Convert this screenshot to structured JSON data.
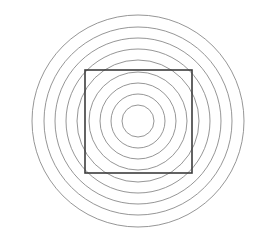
{
  "figure": {
    "background_color": "#ffffff",
    "width": 265,
    "height": 246
  },
  "chart_data": {
    "type": "scatter",
    "title": "",
    "subtitle": "",
    "xlabel": "",
    "ylabel": "",
    "grid": false,
    "legend": false,
    "axes_visible": false,
    "tick_labels": [],
    "annotations": [],
    "center": {
      "x": 138,
      "y": 121
    },
    "shapes": [
      {
        "kind": "circle",
        "name": "ring-1-innermost",
        "index": 1,
        "cx": 138,
        "cy": 121,
        "r": 16,
        "stroke": "#8a8a8a",
        "stroke_width": 0.9,
        "fill": "none"
      },
      {
        "kind": "circle",
        "name": "ring-2",
        "index": 2,
        "cx": 138,
        "cy": 121,
        "r": 27,
        "stroke": "#8a8a8a",
        "stroke_width": 0.9,
        "fill": "none"
      },
      {
        "kind": "circle",
        "name": "ring-3",
        "index": 3,
        "cx": 138,
        "cy": 121,
        "r": 38,
        "stroke": "#8a8a8a",
        "stroke_width": 0.9,
        "fill": "none"
      },
      {
        "kind": "circle",
        "name": "ring-4",
        "index": 4,
        "cx": 138,
        "cy": 121,
        "r": 49,
        "stroke": "#8a8a8a",
        "stroke_width": 0.9,
        "fill": "none"
      },
      {
        "kind": "circle",
        "name": "ring-5",
        "index": 5,
        "cx": 138,
        "cy": 121,
        "r": 61,
        "stroke": "#8a8a8a",
        "stroke_width": 0.9,
        "fill": "none"
      },
      {
        "kind": "circle",
        "name": "ring-6",
        "index": 6,
        "cx": 138,
        "cy": 121,
        "r": 72,
        "stroke": "#8a8a8a",
        "stroke_width": 0.9,
        "fill": "none"
      },
      {
        "kind": "circle",
        "name": "ring-7",
        "index": 7,
        "cx": 138,
        "cy": 121,
        "r": 83,
        "stroke": "#8a8a8a",
        "stroke_width": 0.9,
        "fill": "none"
      },
      {
        "kind": "circle",
        "name": "ring-8",
        "index": 8,
        "cx": 138,
        "cy": 121,
        "r": 94,
        "stroke": "#8a8a8a",
        "stroke_width": 0.9,
        "fill": "none"
      },
      {
        "kind": "circle",
        "name": "ring-9-outermost",
        "index": 9,
        "cx": 138,
        "cy": 121,
        "r": 106,
        "stroke": "#8a8a8a",
        "stroke_width": 0.9,
        "fill": "none"
      },
      {
        "kind": "rect",
        "name": "overlay-square",
        "x": 85,
        "y": 70,
        "width": 107,
        "height": 103,
        "stroke": "#3c3c3c",
        "stroke_width": 1.6,
        "fill": "none"
      }
    ],
    "counts": {
      "circles": 9,
      "squares": 1
    },
    "ring_radii": [
      16,
      27,
      38,
      49,
      61,
      72,
      83,
      94,
      106
    ],
    "ring_spacing": 11.3,
    "colors": {
      "circle_stroke": "#8a8a8a",
      "square_stroke": "#3c3c3c",
      "background": "#ffffff"
    }
  }
}
